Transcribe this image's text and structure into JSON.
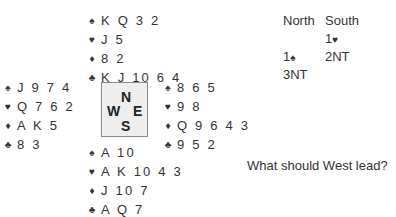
{
  "suit_symbols": {
    "spades": "♠",
    "hearts": "♥",
    "diamonds": "♦",
    "clubs": "♣"
  },
  "hands": {
    "north": {
      "spades": "K Q 3 2",
      "hearts": "J 5",
      "diamonds": "8 2",
      "clubs": "K J 10 6 4"
    },
    "west": {
      "spades": "J 9 7 4",
      "hearts": "Q 7 6 2",
      "diamonds": "A K 5",
      "clubs": "8 3"
    },
    "east": {
      "spades": "8 6 5",
      "hearts": "9 8",
      "diamonds": "Q 9 6 4 3",
      "clubs": "9 5 2"
    },
    "south": {
      "spades": "A 10",
      "hearts": "A K 10 4 3",
      "diamonds": "J 10 7",
      "clubs": "A Q 7"
    }
  },
  "compass": {
    "north": "N",
    "west": "W",
    "east": "E",
    "south": "S"
  },
  "bidding": {
    "headers": [
      "North",
      "South"
    ],
    "rows": [
      {
        "north": "",
        "south": "1",
        "south_suit": "♥"
      },
      {
        "north": "1",
        "north_suit": "♠",
        "south": "2NT"
      },
      {
        "north": "3NT",
        "south": ""
      }
    ]
  },
  "question": "What should West lead?"
}
